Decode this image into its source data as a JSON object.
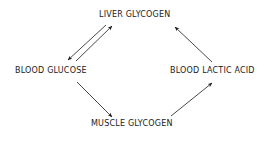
{
  "diagram": {
    "type": "cycle",
    "nodes": {
      "liver_glycogen": "LIVER GLYCOGEN",
      "blood_glucose": "BLOOD GLUCOSE",
      "blood_lactic_acid": "BLOOD LACTIC ACID",
      "muscle_glycogen": "MUSCLE GLYCOGEN"
    },
    "edges": [
      {
        "from": "BLOOD GLUCOSE",
        "to": "LIVER GLYCOGEN"
      },
      {
        "from": "LIVER GLYCOGEN",
        "to": "BLOOD GLUCOSE"
      },
      {
        "from": "BLOOD GLUCOSE",
        "to": "MUSCLE GLYCOGEN"
      },
      {
        "from": "MUSCLE GLYCOGEN",
        "to": "BLOOD LACTIC ACID"
      },
      {
        "from": "BLOOD LACTIC ACID",
        "to": "LIVER GLYCOGEN"
      }
    ],
    "colors": {
      "ink": "#1a1a1a",
      "background": "#ffffff"
    }
  }
}
